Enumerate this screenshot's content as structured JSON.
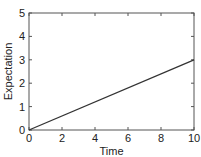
{
  "chart_data": {
    "type": "line",
    "title": "",
    "xlabel": "Time",
    "ylabel": "Expectation",
    "xlim": [
      0,
      10
    ],
    "ylim": [
      0,
      5
    ],
    "xticks": [
      0,
      2,
      4,
      6,
      8,
      10
    ],
    "yticks": [
      0,
      1,
      2,
      3,
      4,
      5
    ],
    "xtick_labels": [
      "0",
      "2",
      "4",
      "6",
      "8",
      "10"
    ],
    "ytick_labels": [
      "0",
      "1",
      "2",
      "3",
      "4",
      "5"
    ],
    "grid": false,
    "legend": null,
    "series": [
      {
        "name": "Expectation",
        "x": [
          0,
          10
        ],
        "y": [
          0,
          3
        ],
        "color": "#333333"
      }
    ]
  }
}
